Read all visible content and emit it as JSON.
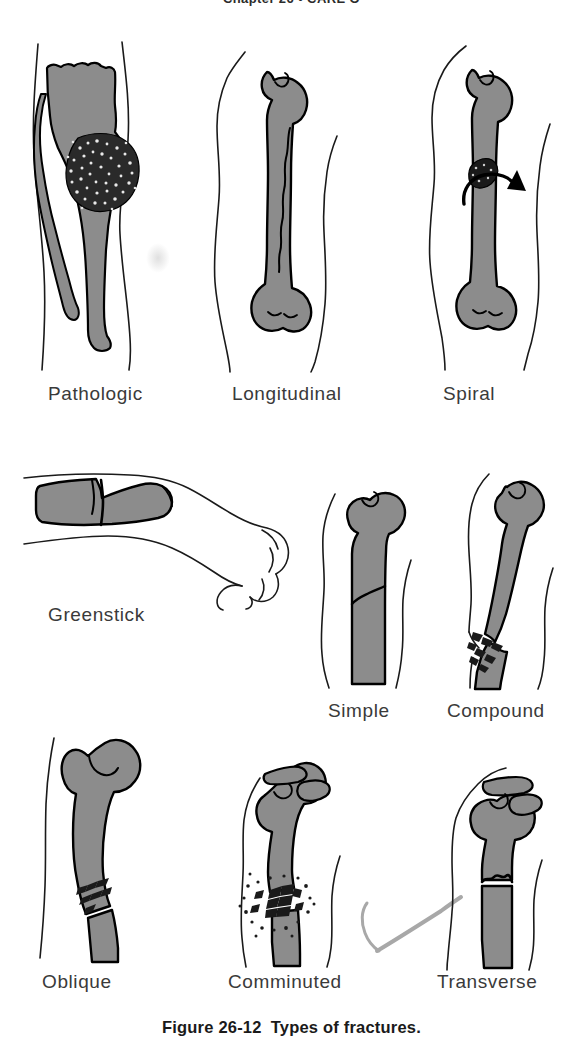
{
  "page": {
    "running_head": "Chapter 26  •  CARE O",
    "background_color": "#ffffff",
    "width": 583,
    "height": 1058
  },
  "caption": {
    "number": "Figure 26-12",
    "text": "Types of fractures."
  },
  "colors": {
    "bone_fill": "#8c8c8c",
    "bone_outline": "#000000",
    "skin_outline": "#1a1a1a",
    "fragment_dark": "#1a1a1a",
    "label_text": "#3a3a3a",
    "caption_text": "#1a1a1a",
    "stray_mark": "#a8a8a8"
  },
  "figure": {
    "title": "Types of fractures",
    "rows": [
      {
        "row": 1,
        "panels": [
          {
            "id": "pathologic",
            "label": "Pathologic",
            "label_x": 48,
            "label_y": 383,
            "description": "Lower leg with tibia and fibula; a mottled tumor mass weakens the bone"
          },
          {
            "id": "longitudinal",
            "label": "Longitudinal",
            "label_x": 232,
            "label_y": 383,
            "description": "Long bone with a crack running lengthwise along the shaft"
          },
          {
            "id": "spiral",
            "label": "Spiral",
            "label_x": 443,
            "label_y": 383,
            "description": "Long bone with a twisting fracture and rotational arrow"
          }
        ]
      },
      {
        "row": 2,
        "panels": [
          {
            "id": "greenstick",
            "label": "Greenstick",
            "label_x": 48,
            "label_y": 604,
            "description": "Forearm and hand; bone bent with an incomplete break on one side"
          },
          {
            "id": "simple",
            "label": "Simple",
            "label_x": 328,
            "label_y": 700,
            "description": "Bone with a single clean break that does not pierce the skin"
          },
          {
            "id": "compound",
            "label": "Compound",
            "label_x": 447,
            "label_y": 700,
            "description": "Broken bone end protruding through the skin"
          }
        ]
      },
      {
        "row": 3,
        "panels": [
          {
            "id": "oblique",
            "label": "Oblique",
            "label_x": 42,
            "label_y": 971,
            "description": "Proximal femur with a slanted diagonal fracture line"
          },
          {
            "id": "comminuted",
            "label": "Comminuted",
            "label_x": 228,
            "label_y": 971,
            "description": "Bone shattered into multiple small fragments"
          },
          {
            "id": "transverse",
            "label": "Transverse",
            "label_x": 437,
            "label_y": 971,
            "description": "Bone with a fracture line straight across the shaft"
          }
        ]
      }
    ]
  }
}
